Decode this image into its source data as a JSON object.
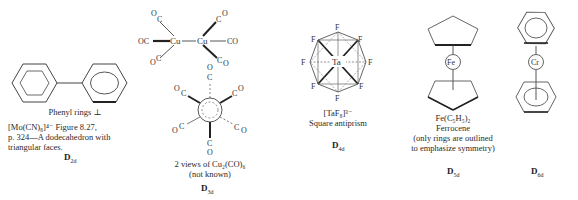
{
  "figure": {
    "panels": [
      {
        "id": "biphenyl",
        "title": "Phenyl rings ⊥",
        "caption_lines": [
          "[Mo(CN)₈]⁴⁻  Figure 8.27,",
          "p. 324—A dodecahedron with",
          "triangular faces."
        ],
        "point_group": {
          "main": "D",
          "sub": "2d"
        }
      },
      {
        "id": "cu2co6",
        "atoms": {
          "metal": "Cu",
          "ligand_c": "C",
          "ligand_o": "O",
          "oc": "OC",
          "co": "CO"
        },
        "caption_lines": [
          "2 views of  Cu₂(CO)₆",
          "(not known)"
        ],
        "point_group": {
          "main": "D",
          "sub": "3d"
        }
      },
      {
        "id": "taf8",
        "atoms": {
          "center": "Ta",
          "ligand": "F"
        },
        "caption_lines": [
          "[TaF₈]³⁻",
          "Square antiprism"
        ],
        "point_group": {
          "main": "D",
          "sub": "4d"
        }
      },
      {
        "id": "ferrocene",
        "atoms": {
          "center": "Fe"
        },
        "caption_lines": [
          "Fe(C₅H₅)₂",
          "Ferrocene",
          "(only rings are outlined",
          "to emphasize symmetry)"
        ],
        "point_group": {
          "main": "D",
          "sub": "5d"
        }
      },
      {
        "id": "dibenzenechromium",
        "atoms": {
          "center": "Cr"
        },
        "caption_lines": [],
        "point_group": {
          "main": "D",
          "sub": "6d"
        }
      }
    ]
  }
}
